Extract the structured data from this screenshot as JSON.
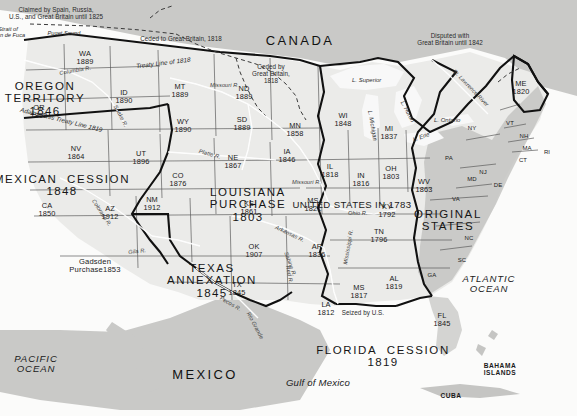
{
  "map": {
    "title": "United States Territorial Acquisitions",
    "countries": [
      {
        "name": "CANADA",
        "x": 300,
        "y": 34
      },
      {
        "name": "MEXICO",
        "x": 205,
        "y": 368
      }
    ],
    "oceans": [
      {
        "name": "PACIFIC\nOCEAN",
        "x": 36,
        "y": 354
      },
      {
        "name": "ATLANTIC\nOCEAN",
        "x": 489,
        "y": 274
      },
      {
        "name": "Gulf of Mexico",
        "x": 318,
        "y": 378
      }
    ],
    "islands": [
      {
        "name": "BAHAMA\nISLANDS",
        "x": 500,
        "y": 362
      },
      {
        "name": "CUBA",
        "x": 451,
        "y": 392
      }
    ],
    "regions": [
      {
        "name": "OREGON\nTERRITORY",
        "year": "1846",
        "x": 45,
        "y": 80
      },
      {
        "name": "MEXICAN  CESSION",
        "year": "1848",
        "x": 62,
        "y": 173
      },
      {
        "name": "LOUISIANA\nPURCHASE",
        "year": "1803",
        "x": 248,
        "y": 186
      },
      {
        "name": "TEXAS\nANNEXATION",
        "year": "1845",
        "x": 212,
        "y": 262
      },
      {
        "name": "UNITED STATES IN 1783",
        "year": "",
        "x": 352,
        "y": 200
      },
      {
        "name": "ORIGINAL\nSTATES",
        "year": "",
        "x": 448,
        "y": 208
      },
      {
        "name": "FLORIDA  CESSION",
        "year": "1819",
        "x": 383,
        "y": 344
      },
      {
        "name": "Gadsden\nPurchase",
        "year": "1853",
        "x": 95,
        "y": 258
      }
    ],
    "states": [
      {
        "abbr": "WA",
        "year": "1889",
        "x": 85,
        "y": 50
      },
      {
        "abbr": "OR",
        "year": "1859",
        "x": 39,
        "y": 104
      },
      {
        "abbr": "ID",
        "year": "1890",
        "x": 124,
        "y": 89
      },
      {
        "abbr": "MT",
        "year": "1889",
        "x": 180,
        "y": 83
      },
      {
        "abbr": "ND",
        "year": "1889",
        "x": 244,
        "y": 85
      },
      {
        "abbr": "SD",
        "year": "1889",
        "x": 242,
        "y": 116
      },
      {
        "abbr": "MN",
        "year": "1858",
        "x": 295,
        "y": 122
      },
      {
        "abbr": "WI",
        "year": "1848",
        "x": 343,
        "y": 112
      },
      {
        "abbr": "MI",
        "year": "1837",
        "x": 389,
        "y": 125
      },
      {
        "abbr": "WY",
        "year": "1890",
        "x": 183,
        "y": 118
      },
      {
        "abbr": "NV",
        "year": "1864",
        "x": 76,
        "y": 145
      },
      {
        "abbr": "UT",
        "year": "1896",
        "x": 141,
        "y": 150
      },
      {
        "abbr": "CO",
        "year": "1876",
        "x": 178,
        "y": 172
      },
      {
        "abbr": "NE",
        "year": "1867",
        "x": 233,
        "y": 154
      },
      {
        "abbr": "IA",
        "year": "1846",
        "x": 287,
        "y": 148
      },
      {
        "abbr": "IL",
        "year": "1818",
        "x": 330,
        "y": 163
      },
      {
        "abbr": "IN",
        "year": "1816",
        "x": 361,
        "y": 172
      },
      {
        "abbr": "OH",
        "year": "1803",
        "x": 391,
        "y": 165
      },
      {
        "abbr": "CA",
        "year": "1850",
        "x": 47,
        "y": 202
      },
      {
        "abbr": "AZ",
        "year": "1912",
        "x": 110,
        "y": 205
      },
      {
        "abbr": "NM",
        "year": "1912",
        "x": 152,
        "y": 196
      },
      {
        "abbr": "KS",
        "year": "1861",
        "x": 249,
        "y": 200
      },
      {
        "abbr": "MS",
        "year": "1821",
        "x": 313,
        "y": 197
      },
      {
        "abbr": "KY",
        "year": "1792",
        "x": 387,
        "y": 203
      },
      {
        "abbr": "WV",
        "year": "1863",
        "x": 424,
        "y": 178
      },
      {
        "abbr": "VA",
        "year": "",
        "x": 456,
        "y": 196
      },
      {
        "abbr": "PA",
        "year": "",
        "x": 449,
        "y": 155
      },
      {
        "abbr": "NY",
        "year": "",
        "x": 472,
        "y": 125
      },
      {
        "abbr": "ME",
        "year": "1820",
        "x": 521,
        "y": 80
      },
      {
        "abbr": "VT",
        "year": "",
        "x": 510,
        "y": 120
      },
      {
        "abbr": "NH",
        "year": "",
        "x": 524,
        "y": 133
      },
      {
        "abbr": "MA",
        "year": "",
        "x": 527,
        "y": 145
      },
      {
        "abbr": "CT",
        "year": "",
        "x": 523,
        "y": 157
      },
      {
        "abbr": "RI",
        "year": "",
        "x": 547,
        "y": 149
      },
      {
        "abbr": "NJ",
        "year": "",
        "x": 483,
        "y": 169
      },
      {
        "abbr": "MD",
        "year": "",
        "x": 472,
        "y": 176
      },
      {
        "abbr": "DE",
        "year": "",
        "x": 498,
        "y": 182
      },
      {
        "abbr": "NC",
        "year": "",
        "x": 469,
        "y": 235
      },
      {
        "abbr": "SC",
        "year": "",
        "x": 462,
        "y": 257
      },
      {
        "abbr": "GA",
        "year": "",
        "x": 432,
        "y": 272
      },
      {
        "abbr": "TN",
        "year": "1796",
        "x": 379,
        "y": 228
      },
      {
        "abbr": "AR",
        "year": "1836",
        "x": 317,
        "y": 243
      },
      {
        "abbr": "OK",
        "year": "1907",
        "x": 254,
        "y": 243
      },
      {
        "abbr": "TX",
        "year": "1845",
        "x": 237,
        "y": 281
      },
      {
        "abbr": "LA",
        "year": "1812",
        "x": 326,
        "y": 301
      },
      {
        "abbr": "MS",
        "year": "1817",
        "x": 359,
        "y": 284
      },
      {
        "abbr": "AL",
        "year": "1819",
        "x": 394,
        "y": 275
      },
      {
        "abbr": "FL",
        "year": "1845",
        "x": 442,
        "y": 312
      }
    ],
    "annotations": [
      {
        "text": "Claimed by Spain, Russia,\nU.S., and Great Britain until 1825",
        "x": 56,
        "y": 7,
        "rot": 0
      },
      {
        "text": "Ceded to Great Britain, 1818",
        "x": 181,
        "y": 36,
        "rot": 0
      },
      {
        "text": "Ceded by\nGreat Britain,\n1818",
        "x": 271,
        "y": 64,
        "rot": 0
      },
      {
        "text": "Disputed with\nGreat Britain until 1842",
        "x": 450,
        "y": 33,
        "rot": 0
      },
      {
        "text": "Treaty Line of 1818",
        "x": 163,
        "y": 60,
        "rot": -7
      },
      {
        "text": "Adams-Onis Treaty Line 1819",
        "x": 62,
        "y": 117,
        "rot": 14
      },
      {
        "text": "Seized by U.S.",
        "x": 363,
        "y": 310,
        "rot": 0
      },
      {
        "text": "Strait of\nJuan de Fuca",
        "x": 8,
        "y": 26,
        "rot": 0
      },
      {
        "text": "Puget Sound",
        "x": 64,
        "y": 30,
        "rot": 0
      }
    ],
    "rivers": [
      {
        "name": "Columbia R.",
        "x": 59,
        "y": 70,
        "rot": -10
      },
      {
        "name": "Snake R.",
        "x": 118,
        "y": 104,
        "rot": 62
      },
      {
        "name": "Missouri R.",
        "x": 210,
        "y": 82,
        "rot": 0
      },
      {
        "name": "Missouri R.",
        "x": 292,
        "y": 179,
        "rot": 0
      },
      {
        "name": "Platte R.",
        "x": 200,
        "y": 148,
        "rot": 16
      },
      {
        "name": "Arkansas R.",
        "x": 277,
        "y": 224,
        "rot": 26
      },
      {
        "name": "Ohio R.",
        "x": 348,
        "y": 210,
        "rot": 0
      },
      {
        "name": "Colorado R.",
        "x": 96,
        "y": 198,
        "rot": 57
      },
      {
        "name": "Gila R.",
        "x": 128,
        "y": 249,
        "rot": -6
      },
      {
        "name": "Pecos R.",
        "x": 222,
        "y": 295,
        "rot": 30
      },
      {
        "name": "Rio Grande",
        "x": 251,
        "y": 311,
        "rot": 62
      },
      {
        "name": "Red R.",
        "x": 291,
        "y": 265,
        "rot": 80
      },
      {
        "name": "Sabine R.",
        "x": 289,
        "y": 251,
        "rot": 70
      },
      {
        "name": "Mississippi R.",
        "x": 342,
        "y": 264,
        "rot": -80
      },
      {
        "name": "St. Lawrence River",
        "x": 456,
        "y": 68,
        "rot": 46
      }
    ],
    "lakes": [
      {
        "name": "L. Superior",
        "x": 352,
        "y": 77
      },
      {
        "name": "L. Michigan",
        "x": 373,
        "y": 110,
        "rot": 80
      },
      {
        "name": "L. Huron",
        "x": 405,
        "y": 100,
        "rot": 62
      },
      {
        "name": "L. Ontario",
        "x": 434,
        "y": 117
      },
      {
        "name": "L. Erie",
        "x": 412,
        "y": 137,
        "rot": -20
      }
    ],
    "colors": {
      "paper": "#fbfbfa",
      "land_foreign": "#c9c9c7",
      "us_land": "#ebebe9",
      "original_states": "#c4c4c2",
      "border_heavy": "#111111",
      "border_thin": "#4a4a4a",
      "water": "#fbfbfb"
    }
  }
}
